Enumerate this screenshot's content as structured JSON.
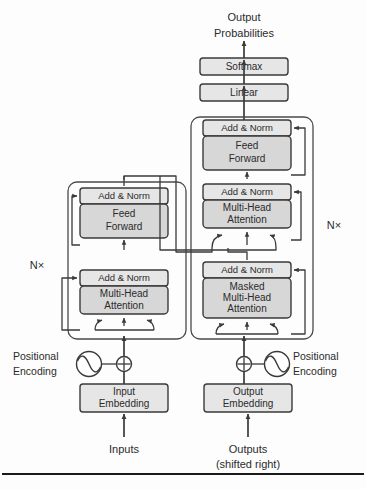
{
  "figure": {
    "background_color": "#fdfdfd",
    "box_fill_shaded": "#d7d7d7",
    "box_fill_light": "#e6e6e6",
    "stroke_color": "#3a3a3a"
  },
  "top": {
    "output_label_line1": "Output",
    "output_label_line2": "Probabilities",
    "softmax": "Softmax",
    "linear": "Linear"
  },
  "encoder": {
    "repeat_label": "N×",
    "add_norm_upper": "Add & Norm",
    "feed_forward_line1": "Feed",
    "feed_forward_line2": "Forward",
    "add_norm_lower": "Add & Norm",
    "attention_line1": "Multi-Head",
    "attention_line2": "Attention",
    "positional_encoding_line1": "Positional",
    "positional_encoding_line2": "Encoding",
    "embedding_line1": "Input",
    "embedding_line2": "Embedding",
    "source_label": "Inputs"
  },
  "decoder": {
    "repeat_label": "N×",
    "add_norm_upper": "Add & Norm",
    "feed_forward_line1": "Feed",
    "feed_forward_line2": "Forward",
    "add_norm_middle": "Add & Norm",
    "cross_attention_line1": "Multi-Head",
    "cross_attention_line2": "Attention",
    "add_norm_lower": "Add & Norm",
    "masked_attention_line1": "Masked",
    "masked_attention_line2": "Multi-Head",
    "masked_attention_line3": "Attention",
    "positional_encoding_line1": "Positional",
    "positional_encoding_line2": "Encoding",
    "embedding_line1": "Output",
    "embedding_line2": "Embedding",
    "source_label_line1": "Outputs",
    "source_label_line2": "(shifted right)"
  }
}
